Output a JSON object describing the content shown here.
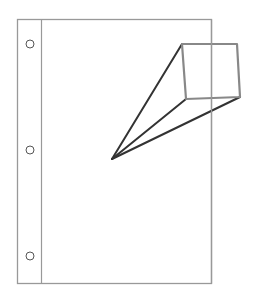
{
  "diagram": {
    "colors": {
      "background": "#ffffff",
      "page_border": "#999999",
      "binding_line": "#999999",
      "holes": "#555555",
      "callout_box": "#888888",
      "callout_lines": "#333333"
    },
    "page": {
      "x": 17,
      "y": 19,
      "width": 194,
      "height": 264
    },
    "binding_strip": {
      "x": 41
    },
    "holes": [
      {
        "cx": 30,
        "cy": 44,
        "r": 4
      },
      {
        "cx": 30,
        "cy": 150,
        "r": 4
      },
      {
        "cx": 30,
        "cy": 256,
        "r": 4
      }
    ],
    "callout": {
      "apex": {
        "x": 112,
        "y": 159
      },
      "box": {
        "tl": {
          "x": 182,
          "y": 44
        },
        "tr": {
          "x": 237,
          "y": 44
        },
        "br": {
          "x": 240,
          "y": 97
        },
        "bl": {
          "x": 186,
          "y": 99
        }
      }
    }
  }
}
